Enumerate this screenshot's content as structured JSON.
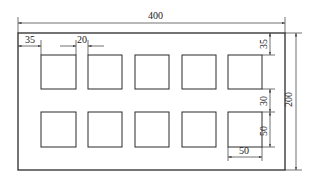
{
  "drawing": {
    "type": "technical-drawing",
    "description": "Rectangular plate with 2 rows x 5 columns of square openings",
    "outer": {
      "width_label": "400",
      "height_label": "200"
    },
    "openings": {
      "rows": 2,
      "cols": 5,
      "size_label": "50"
    },
    "dimensions": {
      "overall_width": "400",
      "overall_height": "200",
      "left_margin": "35",
      "column_gap": "20",
      "top_margin": "35",
      "row_gap": "30",
      "opening_height": "50",
      "opening_width": "50"
    },
    "colors": {
      "line": "#2a2a2a",
      "background": "#ffffff"
    }
  }
}
